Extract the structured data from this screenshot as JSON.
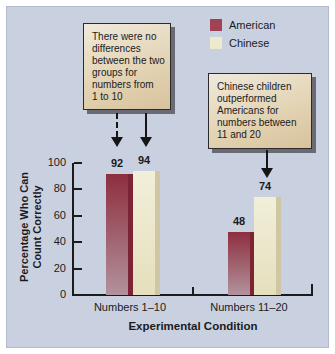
{
  "figure": {
    "panel_background": "#c9d1e1",
    "outer_margin_color": "#ffffff",
    "callout_fill_top": "#efe9dc",
    "callout_fill_bottom": "#d8c29c",
    "callout_shadow": "#6a6a74",
    "text_color": "#1b1b1b"
  },
  "legend": {
    "items": [
      {
        "label": "American",
        "swatch_color": "#a04253"
      },
      {
        "label": "Chinese",
        "swatch_color": "#eeeacc"
      }
    ]
  },
  "annotations": {
    "left_box_text": "There were no\ndifferences\nbetween the two\ngroups for\nnumbers from\n1 to 10",
    "right_box_text": "Chinese children\noutperformed\nAmericans for\nnumbers between\n11 and 20",
    "left_box_arrows": [
      "dashed-arrow-to-american-92",
      "solid-arrow-to-chinese-94"
    ],
    "right_box_arrows": [
      "solid-arrow-to-chinese-74"
    ]
  },
  "labels": {
    "ylabel_display": "Percentage Who Can\nCount Correctly"
  },
  "chart_data": {
    "type": "bar",
    "categories": [
      "Numbers 1–10",
      "Numbers 11–20"
    ],
    "series": [
      {
        "name": "American",
        "values": [
          92,
          48
        ],
        "color_top": "#8e2e3f",
        "color_bottom": "#b2929c",
        "edge_color": "#7c2434"
      },
      {
        "name": "Chinese",
        "values": [
          94,
          74
        ],
        "color_top": "#f2efda",
        "color_bottom": "#e5dfbc",
        "edge_color": "#cfc6a3"
      }
    ],
    "bar_value_labels": [
      [
        92,
        48
      ],
      [
        94,
        74
      ]
    ],
    "xlabel": "Experimental Condition",
    "ylabel": "Percentage Who Can Count Correctly",
    "ylim": [
      0,
      100
    ],
    "yticks": [
      0,
      20,
      40,
      60,
      80,
      100
    ],
    "grid": false,
    "legend_position": "top-right"
  }
}
